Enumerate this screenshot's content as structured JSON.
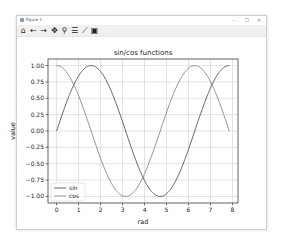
{
  "window": {
    "title": "Figure 1",
    "controls": {
      "minimize": "–",
      "maximize": "☐",
      "close": "✕"
    }
  },
  "toolbar": {
    "buttons": [
      {
        "name": "home",
        "glyph": "⌂"
      },
      {
        "name": "back",
        "glyph": "←"
      },
      {
        "name": "forward",
        "glyph": "→"
      },
      {
        "name": "pan",
        "glyph": "✥"
      },
      {
        "name": "zoom",
        "glyph": "⚲"
      },
      {
        "name": "configure-subplots",
        "glyph": "☰"
      },
      {
        "name": "edit-axes",
        "glyph": "⟋"
      },
      {
        "name": "save",
        "glyph": "▣"
      }
    ]
  },
  "chart_data": {
    "type": "line",
    "title": "sin/cos functions",
    "xlabel": "rad",
    "ylabel": "value",
    "xlim": [
      -0.39,
      8.25
    ],
    "ylim": [
      -1.1,
      1.1
    ],
    "xticks": [
      0,
      1,
      2,
      3,
      4,
      5,
      6,
      7,
      8
    ],
    "xtick_labels": [
      "0",
      "1",
      "2",
      "3",
      "4",
      "5",
      "6",
      "7",
      "8"
    ],
    "yticks": [
      -1.0,
      -0.75,
      -0.5,
      -0.25,
      0.0,
      0.25,
      0.5,
      0.75,
      1.0
    ],
    "ytick_labels": [
      "−1.00",
      "−0.75",
      "−0.50",
      "−0.25",
      "0.00",
      "0.25",
      "0.50",
      "0.75",
      "1.00"
    ],
    "grid": true,
    "legend": {
      "position": "lower-left",
      "entries": [
        "sin",
        "cos"
      ]
    },
    "x_domain": [
      0,
      7.854
    ],
    "samples": 200,
    "series": [
      {
        "name": "sin",
        "function": "sin(x)",
        "color": "#555555"
      },
      {
        "name": "cos",
        "function": "cos(x)",
        "color": "#888888"
      }
    ]
  }
}
